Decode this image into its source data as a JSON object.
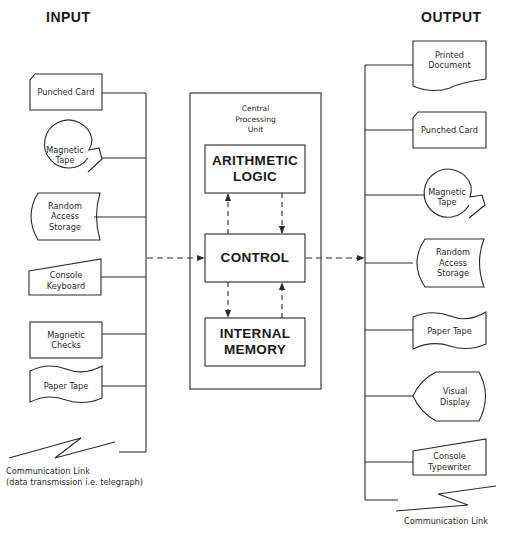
{
  "headings": {
    "input": "INPUT",
    "output": "OUTPUT"
  },
  "cpu": {
    "title": "Central\nProcessing\nUnit",
    "units": {
      "arithmetic_logic": "ARITHMETIC\nLOGIC",
      "control": "CONTROL",
      "internal_memory": "INTERNAL\nMEMORY"
    }
  },
  "input_devices": [
    {
      "label": "Punched Card",
      "shape": "punched-card"
    },
    {
      "label": "Magnetic\nTape",
      "shape": "magnetic-tape"
    },
    {
      "label": "Random\nAccess\nStorage",
      "shape": "random-access-storage"
    },
    {
      "label": "Console\nKeyboard",
      "shape": "manual-input"
    },
    {
      "label": "Magnetic\nChecks",
      "shape": "rectangle"
    },
    {
      "label": "Paper Tape",
      "shape": "paper-tape"
    }
  ],
  "input_comm_link": "Communication Link\n(data transmission i.e. telegraph)",
  "output_devices": [
    {
      "label": "Printed\nDocument",
      "shape": "document"
    },
    {
      "label": "Punched Card",
      "shape": "punched-card"
    },
    {
      "label": "Magnetic\nTape",
      "shape": "magnetic-tape"
    },
    {
      "label": "Random\nAccess\nStorage",
      "shape": "random-access-storage"
    },
    {
      "label": "Paper Tape",
      "shape": "paper-tape"
    },
    {
      "label": "Visual\nDisplay",
      "shape": "display"
    },
    {
      "label": "Console\nTypewriter",
      "shape": "manual-input"
    }
  ],
  "output_comm_link": "Communication Link",
  "colors": {
    "line": "#2b2b2b",
    "background": "#ffffff"
  }
}
